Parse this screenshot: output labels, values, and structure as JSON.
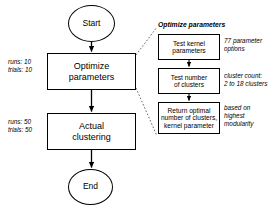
{
  "diagram": {
    "main_flow": {
      "start": "Start",
      "optimize": "Optimize\nparameters",
      "actual": "Actual\nclustering",
      "end": "End"
    },
    "left_annotations": [
      {
        "name": "optimize-runs-trials",
        "text": "runs: 10\ntrials: 10"
      },
      {
        "name": "actual-runs-trials",
        "text": "runs: 50\ntrials: 50"
      }
    ],
    "detail_group": {
      "title": "Optimize parameters",
      "steps": [
        {
          "name": "test-kernel-parameters",
          "label": "Test kernel\nparameters",
          "annotation": "77 parameter\noptions"
        },
        {
          "name": "test-number-of-clusters",
          "label": "Test number\nof clusters",
          "annotation": "cluster count:\n2 to 18 clusters"
        },
        {
          "name": "return-optimal",
          "label": "Return optimal\nnumber of clusters,\nkernel parameter",
          "annotation": "based on\nhighest\nmodularity"
        }
      ]
    },
    "colors": {
      "stroke": "#000000",
      "fill": "#ffffff",
      "callout": "#555555"
    }
  }
}
